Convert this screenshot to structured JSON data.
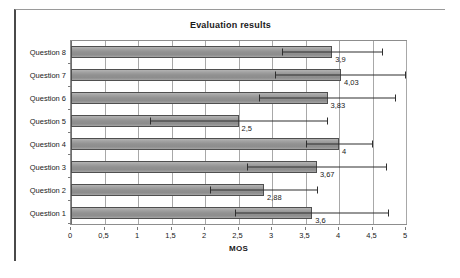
{
  "chart_data": {
    "type": "bar",
    "orientation": "horizontal",
    "title": "Evaluation results",
    "xlabel": "MOS",
    "ylabel": "",
    "xlim": [
      0,
      5
    ],
    "xticks": [
      "0",
      "0,5",
      "1",
      "1,5",
      "2",
      "2,5",
      "3",
      "3,5",
      "4",
      "4,5",
      "5"
    ],
    "xtick_values": [
      0,
      0.5,
      1,
      1.5,
      2,
      2.5,
      3,
      3.5,
      4,
      4.5,
      5
    ],
    "grid": "vertical",
    "legend": "none",
    "categories": [
      "Question 1",
      "Question 2",
      "Question 3",
      "Question 4",
      "Question 5",
      "Question 6",
      "Question 7",
      "Question 8"
    ],
    "values": [
      3.6,
      2.88,
      3.67,
      4,
      2.5,
      3.83,
      4.03,
      3.9
    ],
    "value_labels": [
      "3,6",
      "2,88",
      "3,67",
      "4",
      "2,5",
      "3,83",
      "4,03",
      "3,9"
    ],
    "error_bars": [
      {
        "category": "Question 1",
        "low": 2.45,
        "high": 4.75
      },
      {
        "category": "Question 2",
        "low": 2.08,
        "high": 3.68
      },
      {
        "category": "Question 3",
        "low": 2.62,
        "high": 4.72
      },
      {
        "category": "Question 4",
        "low": 3.5,
        "high": 4.5
      },
      {
        "category": "Question 5",
        "low": 1.18,
        "high": 3.83
      },
      {
        "category": "Question 6",
        "low": 2.8,
        "high": 4.85
      },
      {
        "category": "Question 7",
        "low": 3.05,
        "high": 5.0
      },
      {
        "category": "Question 8",
        "low": 3.15,
        "high": 4.65
      }
    ],
    "colors": {
      "bar_fill": "#999999",
      "bar_outline": "#4f4f4f",
      "error_bar": "#2e2e2e",
      "gridline": "#a8a8a8",
      "axis": "#8d8d8d",
      "text": "#1a1a1a",
      "background": "#ffffff"
    }
  }
}
